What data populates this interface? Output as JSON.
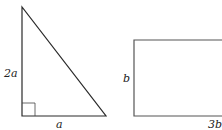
{
  "figure": {
    "triangle": {
      "shape": "right-triangle",
      "height_label": "2a",
      "base_label": "a",
      "right_angle_marker": true,
      "stroke_color": "#2a2a2a"
    },
    "rectangle": {
      "shape": "rectangle",
      "height_label": "b",
      "width_label": "3b",
      "stroke_color": "#555555"
    }
  }
}
